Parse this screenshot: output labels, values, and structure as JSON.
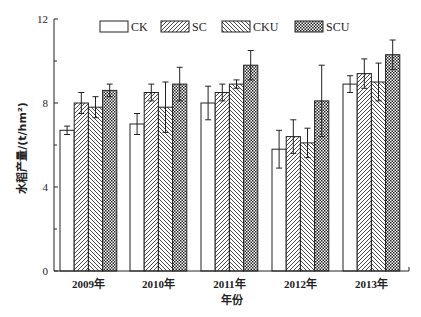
{
  "chart_data": {
    "type": "bar",
    "title": "",
    "xlabel": "年份",
    "ylabel": "水稻产量/(t/hm²)",
    "ylim": [
      0,
      12
    ],
    "yticks": [
      0,
      4,
      8,
      12
    ],
    "minor_yticks": [
      2,
      6,
      10
    ],
    "grid": false,
    "legend_position": "top",
    "categories": [
      "2009年",
      "2010年",
      "2011年",
      "2012年",
      "2013年"
    ],
    "series": [
      {
        "name": "CK",
        "pattern": "white",
        "values": [
          6.7,
          7.0,
          8.0,
          5.8,
          8.9
        ],
        "errors": [
          0.2,
          0.5,
          0.8,
          0.9,
          0.4
        ]
      },
      {
        "name": "SC",
        "pattern": "diagonal-right",
        "values": [
          8.0,
          8.5,
          8.5,
          6.4,
          9.4
        ],
        "errors": [
          0.5,
          0.4,
          0.4,
          0.8,
          0.7
        ]
      },
      {
        "name": "CKU",
        "pattern": "diagonal-left",
        "values": [
          7.8,
          7.8,
          8.9,
          6.1,
          9.0
        ],
        "errors": [
          0.5,
          1.2,
          0.2,
          0.7,
          0.9
        ]
      },
      {
        "name": "SCU",
        "pattern": "crosshatch",
        "values": [
          8.6,
          8.9,
          9.8,
          8.1,
          10.3
        ],
        "errors": [
          0.3,
          0.8,
          0.7,
          1.7,
          0.7
        ]
      }
    ]
  },
  "labels": {
    "y_axis_title": "水稻产量/(t/hm²)",
    "x_axis_title": "年份",
    "caption": ""
  }
}
